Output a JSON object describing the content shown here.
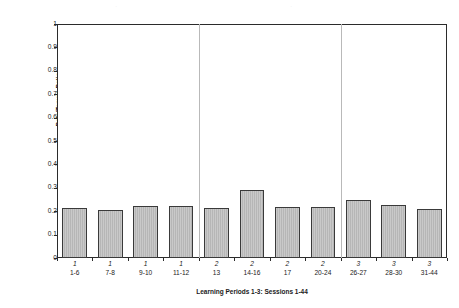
{
  "chart_data": {
    "type": "bar",
    "title": "",
    "xlabel": "Learning Periods 1-3: Sessions 1-44",
    "ylabel": "Rate/Tempo Ratio",
    "ylim": [
      0,
      1
    ],
    "ytick_labels": [
      "1",
      "0.9",
      "0.8",
      "0.7",
      "0.6",
      "0.5",
      "0.4",
      "0.3",
      "0.2",
      "0.1",
      "0"
    ],
    "ytick_values": [
      1,
      0.9,
      0.8,
      0.7,
      0.6,
      0.5,
      0.4,
      0.3,
      0.2,
      0.1,
      0
    ],
    "grid": false,
    "legend": false,
    "categories": [
      "1-6",
      "7-8",
      "9-10",
      "11-12",
      "13",
      "14-16",
      "17",
      "20-24",
      "26-27",
      "28-30",
      "31-44"
    ],
    "period_labels": [
      "1",
      "1",
      "1",
      "1",
      "2",
      "2",
      "2",
      "2",
      "3",
      "3",
      "3"
    ],
    "values": [
      0.215,
      0.206,
      0.223,
      0.223,
      0.213,
      0.291,
      0.218,
      0.219,
      0.248,
      0.226,
      0.211
    ],
    "separators_after": [
      "11-12",
      "20-24"
    ],
    "bar_face_color": "#c2c2c2",
    "bar_edge_color": "#3a3a3a",
    "axis_color": "#2b2b2b",
    "separator_color": "#b9b9b9"
  }
}
